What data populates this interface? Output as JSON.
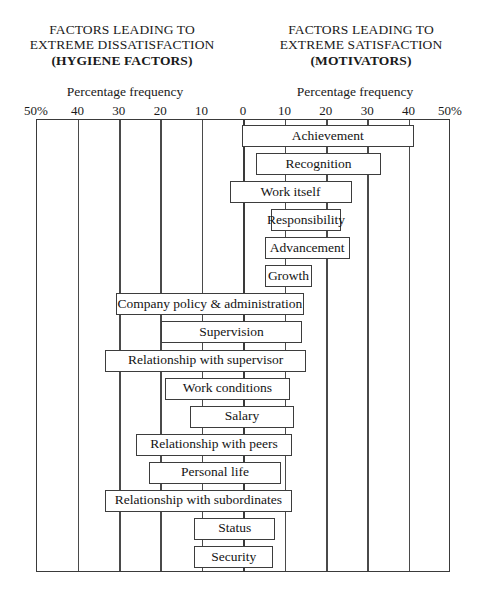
{
  "headings": {
    "left": {
      "line1": "FACTORS LEADING TO",
      "line2": "EXTREME DISSATISFACTION",
      "line3": "(HYGIENE FACTORS)"
    },
    "right": {
      "line1": "FACTORS LEADING TO",
      "line2": "EXTREME SATISFACTION",
      "line3": "(MOTIVATORS)"
    }
  },
  "axis_caption": {
    "left": "Percentage frequency",
    "right": "Percentage frequency"
  },
  "tick_labels": [
    "50%",
    "40",
    "30",
    "20",
    "10",
    "0",
    "10",
    "20",
    "30",
    "40",
    "50%"
  ],
  "chart_data": {
    "type": "bar",
    "orientation": "horizontal",
    "subtype": "diverging-tornado",
    "xlabel": "Percentage frequency",
    "ylabel": "",
    "grid": true,
    "legend": "none",
    "xlim": [
      -50,
      50
    ],
    "xticks": [
      -50,
      -40,
      -30,
      -20,
      -10,
      0,
      10,
      20,
      30,
      40,
      50
    ],
    "xtick_labels": [
      "50%",
      "40",
      "30",
      "20",
      "10",
      "0",
      "10",
      "20",
      "30",
      "40",
      "50%"
    ],
    "left_axis_name": "EXTREME DISSATISFACTION (HYGIENE FACTORS)",
    "right_axis_name": "EXTREME SATISFACTION (MOTIVATORS)",
    "categories": [
      "Achievement",
      "Recognition",
      "Work itself",
      "Responsibility",
      "Advancement",
      "Growth",
      "Company policy & administration",
      "Supervision",
      "Relationship with supervisor",
      "Work conditions",
      "Salary",
      "Relationship with peers",
      "Personal life",
      "Relationship with subordinates",
      "Status",
      "Security"
    ],
    "bars": [
      {
        "label": "Achievement",
        "group": "motivator",
        "start": -0.5,
        "end": 41.0
      },
      {
        "label": "Recognition",
        "group": "motivator",
        "start": 3.0,
        "end": 33.0
      },
      {
        "label": "Work itself",
        "group": "motivator",
        "start": -3.5,
        "end": 26.0
      },
      {
        "label": "Responsibility",
        "group": "motivator",
        "start": 6.5,
        "end": 23.5
      },
      {
        "label": "Advancement",
        "group": "motivator",
        "start": 5.0,
        "end": 25.5
      },
      {
        "label": "Growth",
        "group": "motivator",
        "start": 5.0,
        "end": 16.5
      },
      {
        "label": "Company policy & administration",
        "group": "hygiene",
        "start": -31.0,
        "end": 14.5
      },
      {
        "label": "Supervision",
        "group": "hygiene",
        "start": -20.0,
        "end": 14.0
      },
      {
        "label": "Relationship with supervisor",
        "group": "hygiene",
        "start": -33.5,
        "end": 15.0
      },
      {
        "label": "Work conditions",
        "group": "hygiene",
        "start": -19.0,
        "end": 11.0
      },
      {
        "label": "Salary",
        "group": "hygiene",
        "start": -13.0,
        "end": 12.0
      },
      {
        "label": "Relationship with peers",
        "group": "hygiene",
        "start": -26.0,
        "end": 11.5
      },
      {
        "label": "Personal life",
        "group": "hygiene",
        "start": -23.0,
        "end": 9.0
      },
      {
        "label": "Relationship with subordinates",
        "group": "hygiene",
        "start": -33.5,
        "end": 11.5
      },
      {
        "label": "Status",
        "group": "hygiene",
        "start": -12.0,
        "end": 7.5
      },
      {
        "label": "Security",
        "group": "hygiene",
        "start": -12.0,
        "end": 7.0
      }
    ]
  }
}
